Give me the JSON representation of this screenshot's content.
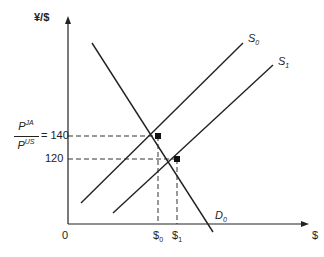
{
  "diagram": {
    "type": "supply-demand",
    "y_axis_label": "¥/$",
    "x_axis_label": "$",
    "origin_label": "0",
    "y_ratio": {
      "numerator": "P",
      "numerator_sup": "JA",
      "denominator": "P",
      "denominator_sup": "US",
      "equals": "= 140"
    },
    "y_tick_120": "120",
    "curves": [
      {
        "name": "S",
        "sub": "0"
      },
      {
        "name": "S",
        "sub": "1"
      },
      {
        "name": "D",
        "sub": "0"
      }
    ],
    "x_ticks": [
      {
        "name": "$",
        "sub": "0"
      },
      {
        "name": "$",
        "sub": "1"
      }
    ],
    "equilibria": [
      {
        "curve": "S0",
        "price": 140,
        "quantity": "$0"
      },
      {
        "curve": "S1",
        "price": 120,
        "quantity": "$1"
      }
    ],
    "line_color": "#222222"
  }
}
